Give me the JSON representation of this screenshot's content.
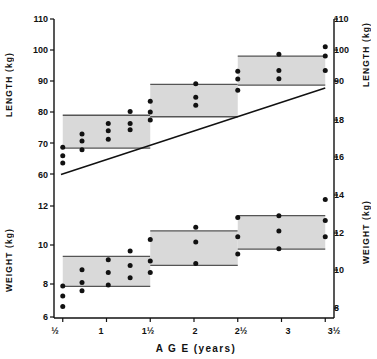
{
  "figure": {
    "background": "#ffffff",
    "ink": "#111111",
    "band_fill": "#d9d9d9",
    "band_stroke": "#555555"
  },
  "axes": {
    "x_title": "A G E   (years)",
    "x_title_plain": "AGE (years)",
    "x_ticks": [
      "½",
      "1",
      "1½",
      "2",
      "2½",
      "3",
      "3½"
    ],
    "x_values": [
      0.5,
      1.0,
      1.5,
      2.0,
      2.5,
      3.0,
      3.5
    ],
    "left_titles": [
      "LENGTH  (kg)",
      "WEIGHT  (kg)"
    ],
    "right_titles": [
      "LENGTH  (kg)",
      "WEIGHT  (kg)"
    ],
    "left_length_ticks": [
      "110",
      "100",
      "90",
      "80",
      "70",
      "60"
    ],
    "left_weight_ticks": [
      "12",
      "10",
      "8",
      "6"
    ],
    "right_length_ticks": [
      "110",
      "100",
      "90"
    ],
    "right_weight_ticks": [
      "18",
      "16",
      "14",
      "12",
      "10",
      "8"
    ]
  },
  "chart_data": {
    "type": "scatter",
    "title": "",
    "subtitle": "",
    "xlabel": "AGE (years)",
    "ylabel": "LENGTH (cm) / WEIGHT (kg)",
    "xlim": [
      0.4,
      3.6
    ],
    "grid": false,
    "legend": "none",
    "panels": [
      {
        "name": "length-panel",
        "ylabel": "LENGTH (kg)",
        "left_axis_ticks": [
          110,
          100,
          90,
          80,
          70,
          60
        ],
        "right_axis_ticks": [
          110,
          100,
          90
        ],
        "ylim": [
          57,
          112
        ],
        "reference_bands": [
          {
            "x_start": 0.5,
            "x_end": 1.5,
            "low": 69.5,
            "high": 80.3
          },
          {
            "x_start": 1.5,
            "x_end": 2.5,
            "low": 79.8,
            "high": 90.5
          },
          {
            "x_start": 2.5,
            "x_end": 3.5,
            "low": 90.2,
            "high": 99.8
          }
        ],
        "points": [
          {
            "x": 0.5,
            "y": 69.8
          },
          {
            "x": 0.5,
            "y": 67.0
          },
          {
            "x": 0.5,
            "y": 64.6
          },
          {
            "x": 0.72,
            "y": 74.1
          },
          {
            "x": 0.72,
            "y": 71.8
          },
          {
            "x": 0.72,
            "y": 68.9
          },
          {
            "x": 1.02,
            "y": 77.6
          },
          {
            "x": 1.02,
            "y": 75.2
          },
          {
            "x": 1.02,
            "y": 72.4
          },
          {
            "x": 1.27,
            "y": 81.5
          },
          {
            "x": 1.27,
            "y": 77.6
          },
          {
            "x": 1.27,
            "y": 75.5
          },
          {
            "x": 1.5,
            "y": 84.9
          },
          {
            "x": 1.5,
            "y": 81.4
          },
          {
            "x": 1.5,
            "y": 78.7
          },
          {
            "x": 2.02,
            "y": 90.7
          },
          {
            "x": 2.02,
            "y": 86.2
          },
          {
            "x": 2.02,
            "y": 83.6
          },
          {
            "x": 2.5,
            "y": 94.8
          },
          {
            "x": 2.5,
            "y": 92.2
          },
          {
            "x": 2.5,
            "y": 88.5
          },
          {
            "x": 2.97,
            "y": 100.4
          },
          {
            "x": 2.97,
            "y": 95.0
          },
          {
            "x": 2.97,
            "y": 92.3
          },
          {
            "x": 3.5,
            "y": 102.9
          },
          {
            "x": 3.5,
            "y": 99.8
          },
          {
            "x": 3.5,
            "y": 95.0
          }
        ],
        "trend_line": {
          "x1": 0.48,
          "y1": 60.8,
          "x2": 3.5,
          "y2": 89.3
        }
      },
      {
        "name": "weight-panel",
        "ylabel": "WEIGHT (kg)",
        "left_axis_ticks": [
          12,
          10,
          8,
          6
        ],
        "right_axis_ticks": [
          18,
          16,
          14,
          12,
          10,
          8
        ],
        "ylim": [
          5.4,
          19.2
        ],
        "reference_bands": [
          {
            "x_start": 0.5,
            "x_end": 1.5,
            "low": 8.7,
            "high": 11.85
          },
          {
            "x_start": 1.5,
            "x_end": 2.5,
            "low": 10.9,
            "high": 14.5
          },
          {
            "x_start": 2.5,
            "x_end": 3.5,
            "low": 12.6,
            "high": 16.1
          }
        ],
        "points": [
          {
            "x": 0.5,
            "y": 8.75
          },
          {
            "x": 0.5,
            "y": 7.7
          },
          {
            "x": 0.5,
            "y": 6.6
          },
          {
            "x": 0.72,
            "y": 10.45
          },
          {
            "x": 0.72,
            "y": 9.1
          },
          {
            "x": 0.72,
            "y": 8.25
          },
          {
            "x": 1.02,
            "y": 11.5
          },
          {
            "x": 1.02,
            "y": 10.15
          },
          {
            "x": 1.02,
            "y": 8.85
          },
          {
            "x": 1.27,
            "y": 12.4
          },
          {
            "x": 1.27,
            "y": 10.9
          },
          {
            "x": 1.27,
            "y": 9.6
          },
          {
            "x": 1.5,
            "y": 13.6
          },
          {
            "x": 1.5,
            "y": 11.35
          },
          {
            "x": 1.5,
            "y": 10.15
          },
          {
            "x": 2.02,
            "y": 14.9
          },
          {
            "x": 2.02,
            "y": 13.35
          },
          {
            "x": 2.02,
            "y": 11.1
          },
          {
            "x": 2.5,
            "y": 15.9
          },
          {
            "x": 2.5,
            "y": 13.9
          },
          {
            "x": 2.5,
            "y": 12.1
          },
          {
            "x": 2.97,
            "y": 16.1
          },
          {
            "x": 2.97,
            "y": 14.5
          },
          {
            "x": 2.97,
            "y": 12.65
          },
          {
            "x": 3.5,
            "y": 17.8
          },
          {
            "x": 3.5,
            "y": 15.6
          },
          {
            "x": 3.5,
            "y": 13.9
          }
        ],
        "trend_line": null
      }
    ]
  },
  "caption": {
    "text": ""
  }
}
